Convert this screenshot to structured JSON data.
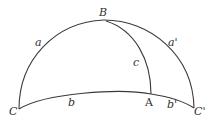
{
  "diagram": {
    "type": "spherical-triangle",
    "stroke_color": "#3a3a3a",
    "text_color": "#333333",
    "vertices": {
      "B": {
        "label": "B",
        "x": 104,
        "y": 20
      },
      "C": {
        "label": "C",
        "x": 19,
        "y": 109
      },
      "C_prime": {
        "label": "C'",
        "x": 194,
        "y": 108
      },
      "A": {
        "label": "A",
        "x": 151,
        "y": 94
      }
    },
    "sides": {
      "a": {
        "label": "a"
      },
      "a_prime": {
        "label": "a'"
      },
      "b": {
        "label": "b"
      },
      "b_prime": {
        "label": "b'"
      },
      "c": {
        "label": "c"
      }
    }
  }
}
